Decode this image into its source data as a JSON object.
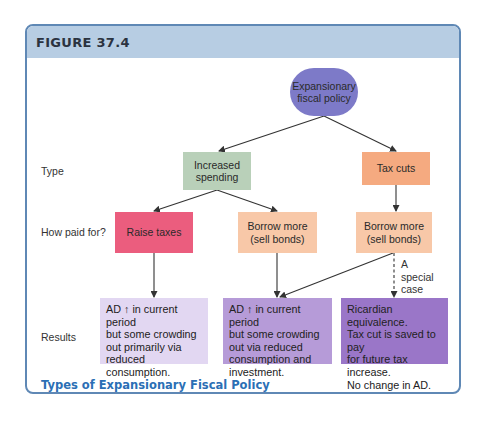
{
  "figure": {
    "label": "FIGURE 37.4",
    "caption": "Types of Expansionary Fiscal Policy",
    "colors": {
      "frame_border": "#5f88b5",
      "header_band": "#b7cde3",
      "caption": "#2b6fb5"
    }
  },
  "row_labels": {
    "type": "Type",
    "how_paid": "How paid for?",
    "results": "Results"
  },
  "nodes": {
    "root": {
      "text_line1": "Expansionary",
      "text_line2": "fiscal policy",
      "color": "#7d7ac8"
    },
    "increased_spending": {
      "text_line1": "Increased",
      "text_line2": "spending",
      "color": "#b9d0b9"
    },
    "tax_cuts": {
      "text": "Tax cuts",
      "color": "#f5aa80"
    },
    "raise_taxes": {
      "text": "Raise taxes",
      "color": "#eb5d7e"
    },
    "borrow_left": {
      "text_line1": "Borrow more",
      "text_line2": "(sell bonds)",
      "color": "#f8c8a8"
    },
    "borrow_right": {
      "text_line1": "Borrow more",
      "text_line2": "(sell bonds)",
      "color": "#f8c8a8"
    }
  },
  "results": [
    {
      "lines": [
        "AD ↑ in current period",
        "but some crowding",
        "out primarily via",
        "reduced consumption."
      ],
      "color": "#e2d7f2"
    },
    {
      "lines": [
        "AD ↑ in current period",
        "but some crowding",
        "out via reduced",
        "consumption and",
        "investment."
      ],
      "color": "#b69bd8"
    },
    {
      "lines": [
        "Ricardian equivalence.",
        "Tax cut is saved to pay",
        "for future tax increase.",
        "No change in AD."
      ],
      "color": "#9a76c8"
    }
  ],
  "special_case_note": {
    "lines": [
      "A",
      "special",
      "case"
    ]
  },
  "edges": [
    {
      "from": "root",
      "to": "increased_spending",
      "style": "solid"
    },
    {
      "from": "root",
      "to": "tax_cuts",
      "style": "solid"
    },
    {
      "from": "increased_spending",
      "to": "raise_taxes",
      "style": "solid"
    },
    {
      "from": "increased_spending",
      "to": "borrow_left",
      "style": "solid"
    },
    {
      "from": "tax_cuts",
      "to": "borrow_right",
      "style": "solid"
    },
    {
      "from": "raise_taxes",
      "to": "result_1",
      "style": "solid"
    },
    {
      "from": "borrow_left",
      "to": "result_2",
      "style": "solid"
    },
    {
      "from": "borrow_right",
      "to": "result_2",
      "style": "solid"
    },
    {
      "from": "borrow_right",
      "to": "result_3",
      "style": "dashed"
    }
  ]
}
